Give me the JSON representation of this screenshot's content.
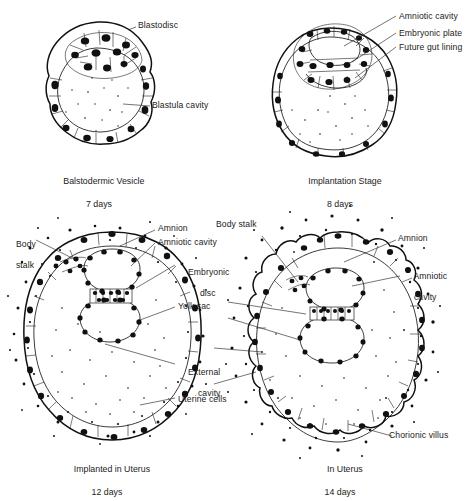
{
  "figure": {
    "background_color": "#ffffff",
    "ink_color": "#111111",
    "panel_count": 4
  },
  "panels": [
    {
      "id": "panel-blastodermic-vesicle",
      "caption_title": "Balstodermic Vesicle",
      "caption_days": "7 days",
      "labels": [
        {
          "name": "blastodisc",
          "text": "Blastodisc"
        },
        {
          "name": "blastula-cavity",
          "text": "Blastula cavity"
        }
      ]
    },
    {
      "id": "panel-implantation-stage",
      "caption_title": "Implantation Stage",
      "caption_days": "8 days",
      "labels": [
        {
          "name": "amniotic-cavity",
          "text": "Amniotic cavity"
        },
        {
          "name": "embryonic-plate",
          "text": "Embryonic plate"
        },
        {
          "name": "future-gut-lining",
          "text": "Future gut lining"
        }
      ]
    },
    {
      "id": "panel-implanted-in-uterus",
      "caption_title": "Implanted in Uterus",
      "caption_days": "12 days",
      "labels": [
        {
          "name": "body-stalk",
          "text_line1": "Body",
          "text_line2": "stalk"
        },
        {
          "name": "amnion",
          "text": "Amnion"
        },
        {
          "name": "amniotic-cavity",
          "text": "Amniotic cavity"
        },
        {
          "name": "embryonic-disc",
          "text_line1": "Embryonic",
          "text_line2": "disc"
        },
        {
          "name": "yolk-sac",
          "text": "Yolk sac"
        },
        {
          "name": "external-cavity",
          "text_line1": "External",
          "text_line2": "cavity"
        },
        {
          "name": "uterine-cells",
          "text": "Uterine cells"
        }
      ]
    },
    {
      "id": "panel-in-uterus",
      "caption_title": "In Uterus",
      "caption_days": "14 days",
      "labels": [
        {
          "name": "body-stalk",
          "text": "Body stalk"
        },
        {
          "name": "amnion",
          "text": "Amnion"
        },
        {
          "name": "amniotic-cavity",
          "text_line1": "Amniotic",
          "text_line2": "cavity"
        },
        {
          "name": "chorionic-villus",
          "text": "Chorionic villus"
        }
      ]
    }
  ]
}
